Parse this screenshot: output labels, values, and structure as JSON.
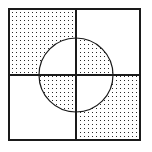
{
  "figure": {
    "canvas_width": 152,
    "canvas_height": 152,
    "background_color": "#ffffff"
  },
  "chart_data": {
    "type": "diagram",
    "subtitle": "",
    "xlabel": "",
    "ylabel": "",
    "grid": false,
    "legend_position": "none",
    "annotations": [],
    "tick_labels": [],
    "shading_rule": "xor",
    "shading_description": "Top-left and bottom-right quadrants are stippled outside the circle; top-right and bottom-left quadrants are stippled inside the circle.",
    "shapes": [
      {
        "name": "outer-square",
        "type": "rect",
        "x": 9,
        "y": 9,
        "width": 131,
        "height": 131,
        "stroke": "#1a1a1a",
        "stroke_width": 2.2,
        "fill": "none"
      },
      {
        "name": "vertical-divider",
        "type": "line",
        "x1": 76,
        "y1": 9,
        "x2": 76,
        "y2": 140,
        "stroke": "#1a1a1a",
        "stroke_width": 1.8
      },
      {
        "name": "horizontal-divider",
        "type": "line",
        "x1": 9,
        "y1": 75,
        "x2": 140,
        "y2": 75,
        "stroke": "#1a1a1a",
        "stroke_width": 1.8
      },
      {
        "name": "inscribed-circle",
        "type": "circle",
        "cx": 76,
        "cy": 75,
        "r": 37,
        "stroke": "#1a1a1a",
        "stroke_width": 1.2,
        "fill": "none"
      }
    ],
    "quadrants": [
      {
        "name": "top-left",
        "x": 9,
        "y": 9,
        "width": 67,
        "height": 66,
        "shaded_region": "outside-circle"
      },
      {
        "name": "top-right",
        "x": 76,
        "y": 9,
        "width": 64,
        "height": 66,
        "shaded_region": "inside-circle"
      },
      {
        "name": "bottom-left",
        "x": 9,
        "y": 75,
        "width": 67,
        "height": 65,
        "shaded_region": "inside-circle"
      },
      {
        "name": "bottom-right",
        "x": 76,
        "y": 75,
        "width": 64,
        "height": 65,
        "shaded_region": "outside-circle"
      }
    ],
    "stipple": {
      "dot_color": "#2b2b2b",
      "dot_size": 1.15,
      "pitch": 4
    },
    "colors": {
      "ink": "#1a1a1a",
      "stipple": "#2b2b2b",
      "background": "#ffffff"
    }
  }
}
